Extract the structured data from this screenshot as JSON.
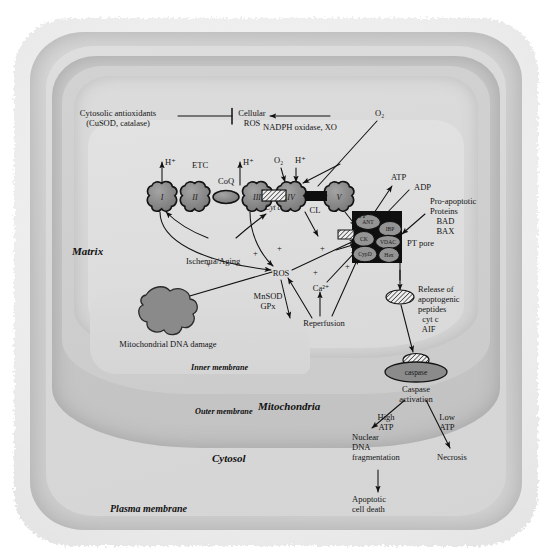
{
  "figure": {
    "domain": "biological-pathway-diagram",
    "compartments": {
      "plasma_membrane": "Plasma membrane",
      "cytosol": "Cytosol",
      "mitochondria": "Mitochondria",
      "outer_membrane": "Outer membrane",
      "inner_membrane": "Inner membrane",
      "matrix": "Matrix"
    },
    "cytosolic_pathway": {
      "antioxidants": "Cytosolic antioxidants\n(CuSOD, catalase)",
      "cellular_ros": "Cellular\nROS",
      "generator_enzymes": "NADPH oxidase, XO",
      "oxygen": "O₂"
    },
    "etc": {
      "label": "ETC",
      "complexes": [
        {
          "name": "I",
          "cx": 162,
          "cy": 196
        },
        {
          "name": "II",
          "cx": 195,
          "cy": 196
        },
        {
          "name": "III",
          "cx": 257,
          "cy": 196
        },
        {
          "name": "IV",
          "cx": 291,
          "cy": 196
        },
        {
          "name": "V",
          "cx": 339,
          "cy": 196
        }
      ],
      "carriers": [
        {
          "name": "CoQ",
          "style": "ellipse",
          "cx": 226,
          "cy": 197
        },
        {
          "name": "Cyt c",
          "style": "hatched",
          "cx": 274,
          "cy": 197
        },
        {
          "name": "CL",
          "style": "solid",
          "cx": 315,
          "cy": 197
        }
      ],
      "proton_labels": [
        "H⁺",
        "H⁺",
        "H⁺"
      ],
      "oxygen_label": "O₂"
    },
    "pt_pore": {
      "label": "PT pore",
      "subunits": [
        {
          "name": "ANT",
          "cx": 368,
          "cy": 222
        },
        {
          "name": "IBP",
          "cx": 389,
          "cy": 228
        },
        {
          "name": "CK",
          "cx": 365,
          "cy": 238
        },
        {
          "name": "VDAC",
          "cx": 387,
          "cy": 241
        },
        {
          "name": "CypD",
          "cx": 365,
          "cy": 253
        },
        {
          "name": "Hex",
          "cx": 388,
          "cy": 253
        }
      ],
      "atp": "ATP",
      "adp": "ADP",
      "atp_from_v": "ATP",
      "pro_apoptotic": "Pro-apoptotic\nProteins\n   BAD\n   BAX"
    },
    "matrix_pathway": {
      "ischemia_aging": "Ischemia/Aging",
      "ros": "ROS",
      "antioxidant_enzymes": "MnSOD\nGPx",
      "calcium": "Ca²⁺",
      "reperfusion": "Reperfusion",
      "mtdna_damage": "Mitochondrial DNA damage",
      "plus_signs": [
        "+",
        "+",
        "+",
        "+",
        "+",
        "+"
      ]
    },
    "apoptosis_cascade": {
      "release": "Release of\napoptogenic\npeptides\n  cyt c\n  AIF",
      "release_italic_item": "cyt c",
      "caspase_shape_label": "caspase",
      "caspase_activation": "Caspase\nactivation",
      "high_atp": "High\nATP",
      "low_atp": "Low\nATP",
      "nuclear_dna_frag": "Nuclear\nDNA\nfragmentation",
      "apoptotic_death": "Apoptotic\ncell death",
      "necrosis": "Necrosis"
    },
    "colors": {
      "complex_fill": "#8c8c8c",
      "complex_stroke": "#1c1c1c",
      "pore_box": "#141414",
      "page_bg": "#ffffff",
      "cytosol": "#d6d6d6",
      "matrix": "#dcdcdc",
      "mtdna": "#8a8a8a"
    }
  }
}
